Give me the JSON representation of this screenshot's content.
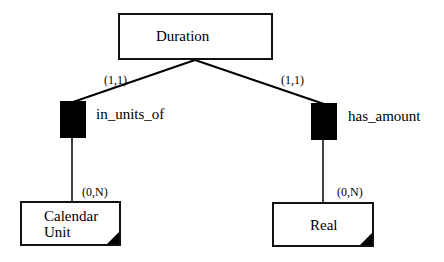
{
  "entities": {
    "duration": {
      "label": "Duration"
    },
    "calendar_unit": {
      "label_line1": "Calendar",
      "label_line2": "Unit"
    },
    "real": {
      "label": "Real"
    }
  },
  "relationships": {
    "in_units_of": {
      "label": "in_units_of",
      "card_top": "(1,1)",
      "card_bottom": "(0,N)"
    },
    "has_amount": {
      "label": "has_amount",
      "card_top": "(1,1)",
      "card_bottom": "(0,N)"
    }
  }
}
